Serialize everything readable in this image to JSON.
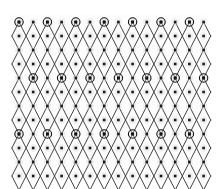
{
  "figure": {
    "type": "lattice-diagram",
    "title": "",
    "width": 218,
    "height": 189,
    "background_color": "#ffffff",
    "panel_background_color": "#fdfdfd"
  },
  "chart_data": {
    "type": "scatter",
    "title": "",
    "xlabel": "",
    "ylabel": "",
    "grid": false,
    "legend": null,
    "lattice": {
      "origin_x": 19,
      "origin_y": 22,
      "column_spacing": 14.2,
      "row_spacing": 14.0,
      "columns": 14,
      "rows": 12,
      "stagger_offset_x": 0
    },
    "dot_sites": {
      "label": "lattice site",
      "marker": "square",
      "size_px": 2.6,
      "color": "#1a1a1a",
      "halo_color": "#d8d8d8",
      "halo_size_px": 7.5,
      "count": 168
    },
    "ring_sites": {
      "label": "superlattice site",
      "marker": "ringed-square",
      "outer_radius_px": 4.2,
      "inner_size_px": 2.8,
      "color": "#111111",
      "ring_stroke_width": 1.1,
      "column_period": 2,
      "row_period": 4,
      "column_phase": 0,
      "row_phase": 0,
      "row_shift_per_period": 1,
      "count": 35
    },
    "chains": {
      "label": "zigzag chain bond",
      "stroke_color": "#3a3a3a",
      "stroke_width": 0.95,
      "pattern": "alternating diagonal zigzag, period 2 rows",
      "segments_per_chain": 12,
      "chain_count": 15
    },
    "axis_ranges": {
      "xlim": [
        0,
        218
      ],
      "ylim": [
        0,
        189
      ]
    }
  }
}
